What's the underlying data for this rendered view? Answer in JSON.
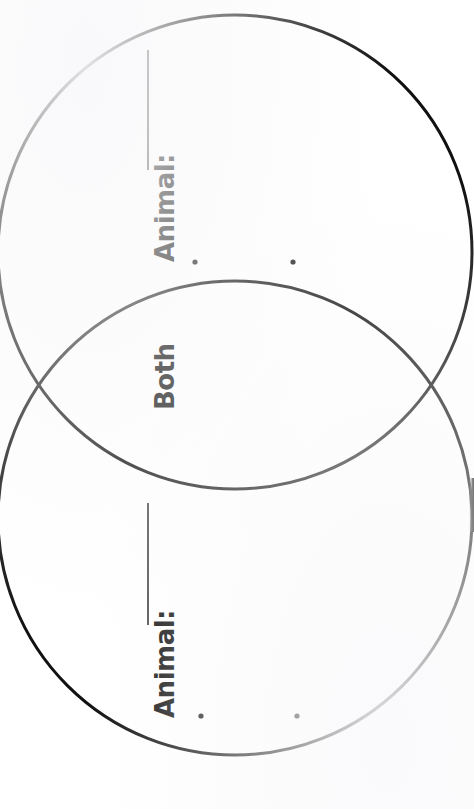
{
  "page": {
    "width": 474,
    "height": 809,
    "background_color": "#ffffff",
    "ink_color": "#111111",
    "orientation_note": "labels rotated 90 degrees counter-clockwise"
  },
  "diagram": {
    "type": "venn-two-circle",
    "stroke_color": "#111111",
    "stroke_width": 3,
    "fill": "none",
    "circles": [
      {
        "name": "top-circle",
        "cx": 235,
        "cy": 252,
        "r": 237
      },
      {
        "name": "bottom-circle",
        "cx": 235,
        "cy": 518,
        "r": 237
      }
    ],
    "intersections": [
      {
        "x": 47,
        "y": 385
      },
      {
        "x": 432,
        "y": 385
      }
    ]
  },
  "labels": {
    "animal_top": "Animal:",
    "both": "Both",
    "animal_bottom": "Animal:"
  },
  "write_lines": [
    {
      "name": "animal-top-write-line",
      "x": 148,
      "y1": 50,
      "y2": 170
    },
    {
      "name": "animal-bottom-write-line",
      "x": 148,
      "y1": 503,
      "y2": 625
    }
  ],
  "bullet_dots": [
    {
      "name": "bullet-dot-top-left",
      "cx": 195,
      "cy": 262,
      "r": 2.6
    },
    {
      "name": "bullet-dot-top-right",
      "cx": 293,
      "cy": 262,
      "r": 2.6
    },
    {
      "name": "bullet-dot-bottom-left",
      "cx": 201,
      "cy": 716,
      "r": 2.6
    },
    {
      "name": "bullet-dot-bottom-right",
      "cx": 297,
      "cy": 716,
      "r": 2.6
    }
  ]
}
